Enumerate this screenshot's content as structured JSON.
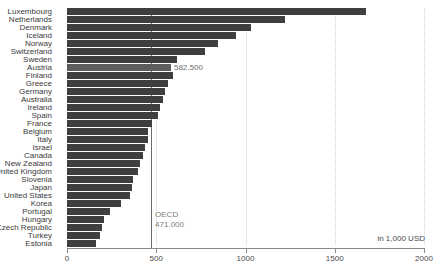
{
  "chart_data": {
    "type": "bar",
    "orientation": "horizontal",
    "title": "",
    "xlabel": "in 1,000 USD",
    "ylabel": "",
    "xlim": [
      0,
      2000
    ],
    "xticks": [
      0,
      500,
      1000,
      1500,
      2000
    ],
    "xtick_labels": [
      "0",
      "500",
      "1000",
      "1500",
      "2000"
    ],
    "grid": true,
    "gridlines": [
      500,
      1000,
      1500,
      2000
    ],
    "legend": "none",
    "categories": [
      "Luxembourg",
      "Netherlands",
      "Denmark",
      "Iceland",
      "Norway",
      "Switzerland",
      "Sweden",
      "Austria",
      "Finland",
      "Greece",
      "Germany",
      "Australia",
      "Ireland",
      "Spain",
      "France",
      "Belgium",
      "Italy",
      "Israel",
      "Canada",
      "New Zealand",
      "United Kingdom",
      "Slovenia",
      "Japan",
      "United States",
      "Korea",
      "Portugal",
      "Hungary",
      "Czech Republic",
      "Turkey",
      "Estonia"
    ],
    "values": [
      1675,
      1220,
      1030,
      945,
      845,
      775,
      617,
      582.5,
      594,
      566,
      549,
      538,
      521,
      510,
      477,
      455,
      453,
      437,
      426,
      409,
      398,
      370,
      364,
      353,
      303,
      241,
      207,
      196,
      185,
      163
    ],
    "highlight_category": "Austria",
    "annotations": [
      {
        "name": "austria-value",
        "text": "582.500",
        "value": 582.5,
        "category": "Austria"
      },
      {
        "name": "oecd-reference",
        "label": "OECD",
        "text": "471.000",
        "value": 471
      }
    ],
    "reference_line": {
      "label": "OECD",
      "value": 471,
      "value_text": "471.000"
    }
  },
  "colors": {
    "bar": "#3f3f3f",
    "bar_highlight": "#5d5d5d",
    "grid": "#cfcfcf",
    "axis": "#8a8a8a",
    "reference_line": "#6a6a6a",
    "text": "#3b3b3b",
    "annotation_text": "#7d7d7d"
  }
}
